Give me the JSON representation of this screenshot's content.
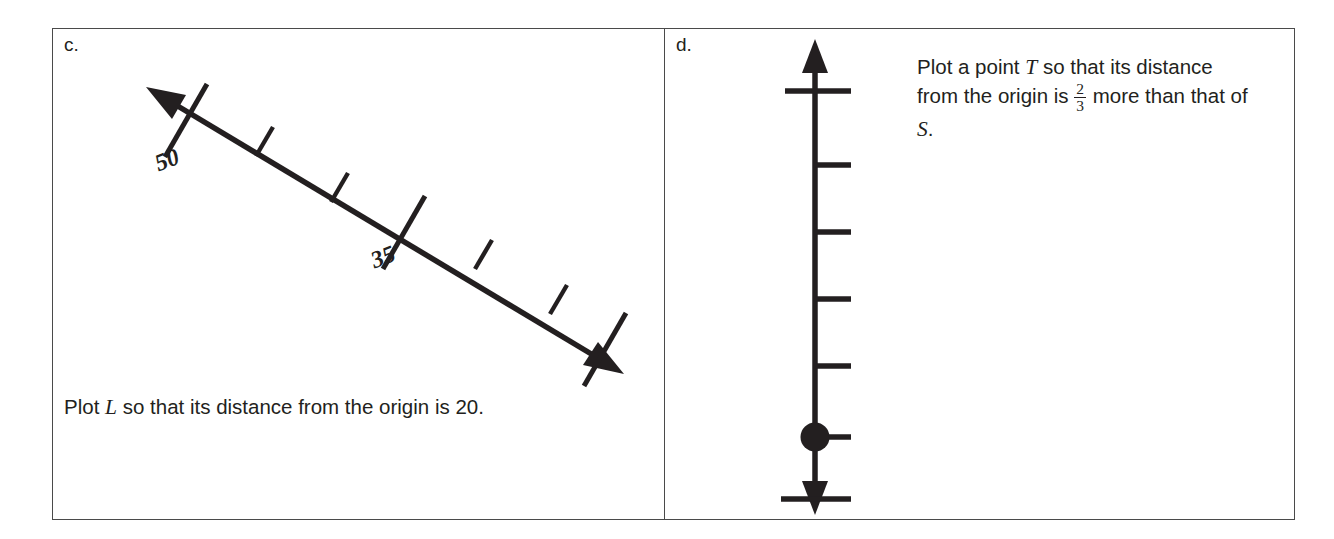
{
  "page": {
    "background": "#ffffff",
    "ink": "#231f20",
    "border_color": "#4a4a4a"
  },
  "panels": [
    {
      "id": "c",
      "label": "c.",
      "diagram": {
        "kind": "number-line",
        "orientation": "diagonal-descending",
        "arrows": [
          "start",
          "end"
        ],
        "labeled_ticks": [
          {
            "value": "50",
            "position": "upper-left"
          },
          {
            "value": "35",
            "position": "middle"
          }
        ],
        "unlabeled_tick_count": 4
      },
      "caption": {
        "before": "Plot ",
        "variable": "L",
        "after": " so that its distance from the origin is 20."
      }
    },
    {
      "id": "d",
      "label": "d.",
      "diagram": {
        "kind": "number-line",
        "orientation": "vertical",
        "arrows": [
          "top",
          "bottom"
        ],
        "labeled_ticks": [
          {
            "value": "5",
            "position": "top"
          },
          {
            "value_whole": "4",
            "value_numerator": "1",
            "value_denominator": "3",
            "position": "lower-middle"
          },
          {
            "value": "4",
            "position": "bottom"
          }
        ],
        "unlabeled_tick_count": 3,
        "plotted_point": {
          "label": "S",
          "side": "left"
        }
      },
      "caption": {
        "part1": "Plot a point ",
        "variable1": "T",
        "part2": " so that its distance from the origin is ",
        "numerator": "2",
        "denominator": "3",
        "part3": " more than that of ",
        "variable2": "S",
        "part4": "."
      }
    }
  ]
}
